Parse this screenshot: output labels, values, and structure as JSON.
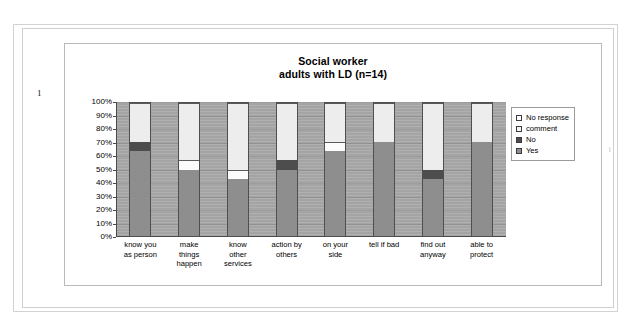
{
  "page": {
    "left_margin_mark": "1",
    "right_margin_mark": "|"
  },
  "chart_data": {
    "type": "bar",
    "stacked": true,
    "stacked_mode": "percent",
    "title": "Social worker\nadults with LD (n=14)",
    "title_line1": "Social worker",
    "title_line2": "adults with LD (n=14)",
    "xlabel": "",
    "ylabel": "",
    "ylim": [
      0,
      100
    ],
    "ytick_labels": [
      "100%",
      "90%",
      "80%",
      "70%",
      "60%",
      "50%",
      "40%",
      "30%",
      "20%",
      "10%",
      "0%"
    ],
    "ytick_values": [
      100,
      90,
      80,
      70,
      60,
      50,
      40,
      30,
      20,
      10,
      0
    ],
    "grid": true,
    "legend_position": "right",
    "legend_entries": [
      "No response",
      "comment",
      "No",
      "Yes"
    ],
    "categories": [
      "know you\nas person",
      "make\nthings\nhappen",
      "know\nother\nservices",
      "action by\nothers",
      "on your\nside",
      "tell if bad",
      "find out\nanyway",
      "able to\nprotect"
    ],
    "series": [
      {
        "name": "Yes",
        "color": "#8e8e8e",
        "values": [
          64,
          50,
          43,
          50,
          64,
          71,
          43,
          71
        ]
      },
      {
        "name": "No",
        "color": "#4d4d4d",
        "values": [
          7,
          0,
          0,
          7,
          0,
          0,
          7,
          0
        ]
      },
      {
        "name": "comment",
        "color": "#fbfbfb",
        "values": [
          0,
          7,
          7,
          0,
          7,
          0,
          0,
          0
        ]
      },
      {
        "name": "No response",
        "color": "#ededed",
        "values": [
          29,
          43,
          50,
          43,
          29,
          29,
          50,
          29
        ]
      }
    ]
  }
}
